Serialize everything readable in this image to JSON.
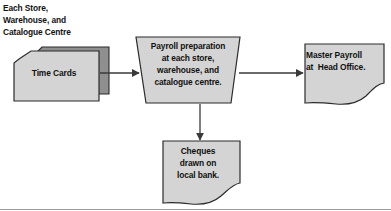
{
  "diagram": {
    "type": "flowchart",
    "caption": "Each Store,\nWarehouse, and\nCatalogue Centre",
    "nodes": {
      "time_cards": {
        "label": "Time Cards",
        "shape": "stacked-cards",
        "fill": "#d4d4d4",
        "back_fill": "#8f8f8f",
        "stroke": "#2b2b2b"
      },
      "payroll_process": {
        "label": "Payroll preparation\nat each store,\nwarehouse, and\ncatalogue centre.",
        "shape": "trapezoid",
        "fill": "#d4d4d4",
        "stroke": "#2b2b2b"
      },
      "master_payroll": {
        "label": "Master Payroll\nat  Head Office.",
        "shape": "document-torn-bottom",
        "fill": "#d4d4d4",
        "stroke": "#2b2b2b"
      },
      "cheques": {
        "label": "Cheques\ndrawn on\nlocal bank.",
        "shape": "document-torn-bottom",
        "fill": "#d4d4d4",
        "stroke": "#2b2b2b"
      }
    },
    "connectors": [
      {
        "name": "time-cards-to-process",
        "from": "time_cards",
        "to": "payroll_process",
        "direction": "right",
        "arrowhead": true
      },
      {
        "name": "process-to-master-payroll",
        "from": "payroll_process",
        "to": "master_payroll",
        "direction": "right",
        "arrowhead": true
      },
      {
        "name": "process-to-cheques",
        "from": "payroll_process",
        "to": "cheques",
        "direction": "down",
        "arrowhead": true
      }
    ],
    "frame": {
      "bottom_rule": true,
      "rule_color": "#9a9a9a"
    },
    "colors": {
      "background": "#ffffff",
      "text": "#111111",
      "shape_fill": "#d4d4d4",
      "shape_fill_dark": "#8f8f8f",
      "shape_stroke": "#2b2b2b",
      "connector": "#3a3a3a"
    }
  }
}
